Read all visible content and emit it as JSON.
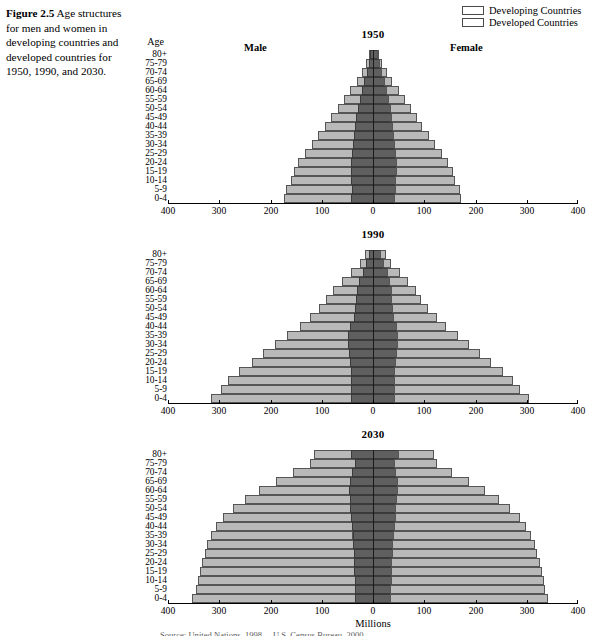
{
  "caption": {
    "figure_number": "Figure 2.5",
    "text": "Age structures for men and women in developing countries and developed countries for 1950, 1990, and 2030."
  },
  "legend": {
    "items": [
      {
        "label": "Developing Countries",
        "color": "#b9b9b9"
      },
      {
        "label": "Developed Countries",
        "color": "#5f5f5f"
      }
    ]
  },
  "labels": {
    "age_axis_title": "Age",
    "male": "Male",
    "female": "Female",
    "x_axis_title": "Millions"
  },
  "source": "Source: United Nations, 1998 ... U.S. Census Bureau, 2000",
  "chart_data": [
    {
      "type": "bar",
      "subtype": "population-pyramid",
      "title": "1950",
      "xlabel": "Millions",
      "ylabel": "Age",
      "xlim": [
        -400,
        400
      ],
      "xticks": [
        400,
        300,
        200,
        100,
        0,
        100,
        200,
        300,
        400
      ],
      "grid": false,
      "legend_position": "top-right",
      "categories": [
        "80+",
        "75-79",
        "70-74",
        "65-69",
        "60-64",
        "55-59",
        "50-54",
        "45-49",
        "40-44",
        "35-39",
        "30-34",
        "25-29",
        "20-24",
        "15-19",
        "10-14",
        "5-9",
        "0-4"
      ],
      "series": [
        {
          "name": "Male Developed",
          "side": "left",
          "color": "#5f5f5f",
          "values": [
            5,
            8,
            12,
            17,
            22,
            26,
            30,
            33,
            35,
            37,
            39,
            41,
            43,
            43,
            42,
            41,
            42
          ]
        },
        {
          "name": "Male Developing",
          "side": "left",
          "color": "#b9b9b9",
          "values": [
            3,
            5,
            9,
            15,
            22,
            30,
            39,
            48,
            58,
            70,
            80,
            92,
            103,
            112,
            118,
            129,
            132
          ]
        },
        {
          "name": "Female Developed",
          "side": "right",
          "color": "#5f5f5f",
          "values": [
            7,
            11,
            16,
            21,
            26,
            30,
            33,
            35,
            37,
            39,
            41,
            43,
            44,
            44,
            43,
            42,
            41
          ]
        },
        {
          "name": "Female Developing",
          "side": "right",
          "color": "#b9b9b9",
          "values": [
            3,
            5,
            9,
            15,
            22,
            30,
            39,
            48,
            57,
            68,
            79,
            90,
            101,
            110,
            115,
            125,
            128
          ]
        }
      ]
    },
    {
      "type": "bar",
      "subtype": "population-pyramid",
      "title": "1990",
      "xlabel": "Millions",
      "ylabel": "Age",
      "xlim": [
        -400,
        400
      ],
      "xticks": [
        400,
        300,
        200,
        100,
        0,
        100,
        200,
        300,
        400
      ],
      "grid": false,
      "legend_position": "top-right",
      "categories": [
        "80+",
        "75-79",
        "70-74",
        "65-69",
        "60-64",
        "55-59",
        "50-54",
        "45-49",
        "40-44",
        "35-39",
        "30-34",
        "25-29",
        "20-24",
        "15-19",
        "10-14",
        "5-9",
        "0-4"
      ],
      "series": [
        {
          "name": "Male Developed",
          "side": "left",
          "color": "#5f5f5f",
          "values": [
            8,
            13,
            20,
            27,
            32,
            33,
            36,
            38,
            45,
            48,
            48,
            47,
            45,
            43,
            42,
            42,
            42
          ]
        },
        {
          "name": "Male Developing",
          "side": "left",
          "color": "#b9b9b9",
          "values": [
            8,
            13,
            22,
            33,
            46,
            58,
            70,
            85,
            98,
            120,
            143,
            167,
            192,
            218,
            240,
            255,
            275
          ]
        },
        {
          "name": "Female Developed",
          "side": "right",
          "color": "#5f5f5f",
          "values": [
            14,
            20,
            27,
            32,
            36,
            35,
            37,
            39,
            45,
            47,
            47,
            45,
            43,
            41,
            40,
            40,
            40
          ]
        },
        {
          "name": "Female Developing",
          "side": "right",
          "color": "#b9b9b9",
          "values": [
            9,
            14,
            23,
            34,
            46,
            57,
            69,
            83,
            96,
            117,
            139,
            162,
            186,
            210,
            231,
            245,
            262
          ]
        }
      ]
    },
    {
      "type": "bar",
      "subtype": "population-pyramid",
      "title": "2030",
      "xlabel": "Millions",
      "ylabel": "Age",
      "xlim": [
        -400,
        400
      ],
      "xticks": [
        400,
        300,
        200,
        100,
        0,
        100,
        200,
        300,
        400
      ],
      "grid": false,
      "legend_position": "top-right",
      "categories": [
        "80+",
        "75-79",
        "70-74",
        "65-69",
        "60-64",
        "55-59",
        "50-54",
        "45-49",
        "40-44",
        "35-39",
        "30-34",
        "25-29",
        "20-24",
        "15-19",
        "10-14",
        "5-9",
        "0-4"
      ],
      "series": [
        {
          "name": "Male Developed",
          "side": "left",
          "color": "#5f5f5f",
          "values": [
            42,
            36,
            41,
            45,
            46,
            45,
            44,
            43,
            41,
            40,
            39,
            38,
            37,
            37,
            36,
            36,
            36
          ]
        },
        {
          "name": "Male Developing",
          "side": "left",
          "color": "#b9b9b9",
          "values": [
            73,
            86,
            115,
            145,
            176,
            205,
            230,
            250,
            265,
            277,
            285,
            290,
            296,
            300,
            305,
            310,
            318
          ]
        },
        {
          "name": "Female Developed",
          "side": "right",
          "color": "#5f5f5f",
          "values": [
            48,
            40,
            43,
            46,
            46,
            45,
            43,
            42,
            40,
            39,
            38,
            37,
            36,
            35,
            35,
            34,
            34
          ]
        },
        {
          "name": "Female Developing",
          "side": "right",
          "color": "#b9b9b9",
          "values": [
            69,
            82,
            110,
            140,
            170,
            198,
            222,
            242,
            256,
            268,
            276,
            282,
            288,
            292,
            296,
            300,
            305
          ]
        }
      ]
    }
  ]
}
